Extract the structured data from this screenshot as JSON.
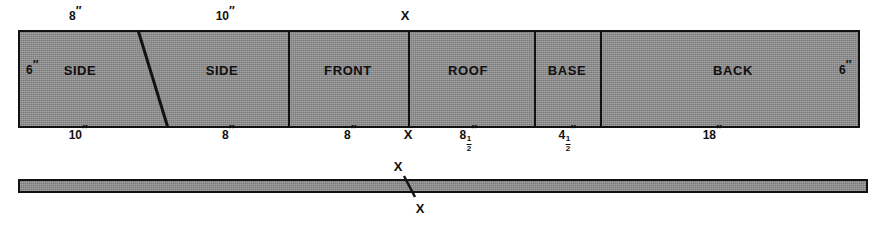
{
  "diagram": {
    "colors": {
      "board_fill": "#8d8d8d",
      "outline": "#121212",
      "text": "#101010"
    },
    "plan_view": {
      "panels": [
        {
          "label": "SIDE",
          "center_x": 80
        },
        {
          "label": "SIDE",
          "center_x": 222
        },
        {
          "label": "FRONT",
          "center_x": 348
        },
        {
          "label": "ROOF",
          "center_x": 468
        },
        {
          "label": "BASE",
          "center_x": 567
        },
        {
          "label": "BACK",
          "center_x": 733
        }
      ],
      "dividers_x": [
        288,
        408,
        534,
        600
      ],
      "diagonal": {
        "x1": 138,
        "y1": 30,
        "x2": 168,
        "y2": 128
      },
      "top_dimensions": [
        {
          "value": "8",
          "unit": "″",
          "x": 75
        },
        {
          "value": "10",
          "unit": "″",
          "x": 225
        }
      ],
      "bottom_dimensions": [
        {
          "value": "10",
          "unit": "″",
          "x": 78,
          "fraction": null
        },
        {
          "value": "8",
          "unit": "″",
          "x": 228,
          "fraction": null
        },
        {
          "value": "8",
          "unit": "″",
          "x": 350,
          "fraction": null
        },
        {
          "value": "8",
          "unit": "″",
          "x": 468,
          "fraction": {
            "num": "1",
            "den": "2"
          }
        },
        {
          "value": "4",
          "unit": "″",
          "x": 567,
          "fraction": {
            "num": "1",
            "den": "2"
          }
        },
        {
          "value": "18",
          "unit": "″",
          "x": 712,
          "fraction": null
        }
      ],
      "side_dimensions": [
        {
          "value": "6",
          "unit": "″",
          "x": 32,
          "side": "left"
        },
        {
          "value": "6",
          "unit": "″",
          "x": 845,
          "side": "right"
        }
      ],
      "x_markers": [
        {
          "label": "X",
          "x": 405,
          "y": 15
        },
        {
          "label": "X",
          "x": 408,
          "y": 134
        }
      ]
    },
    "edge_view": {
      "diagonal": {
        "x1": 404,
        "y1": 176,
        "x2": 415,
        "y2": 197
      },
      "x_markers": [
        {
          "label": "X",
          "x": 398,
          "y": 166
        },
        {
          "label": "X",
          "x": 420,
          "y": 208
        }
      ]
    }
  }
}
